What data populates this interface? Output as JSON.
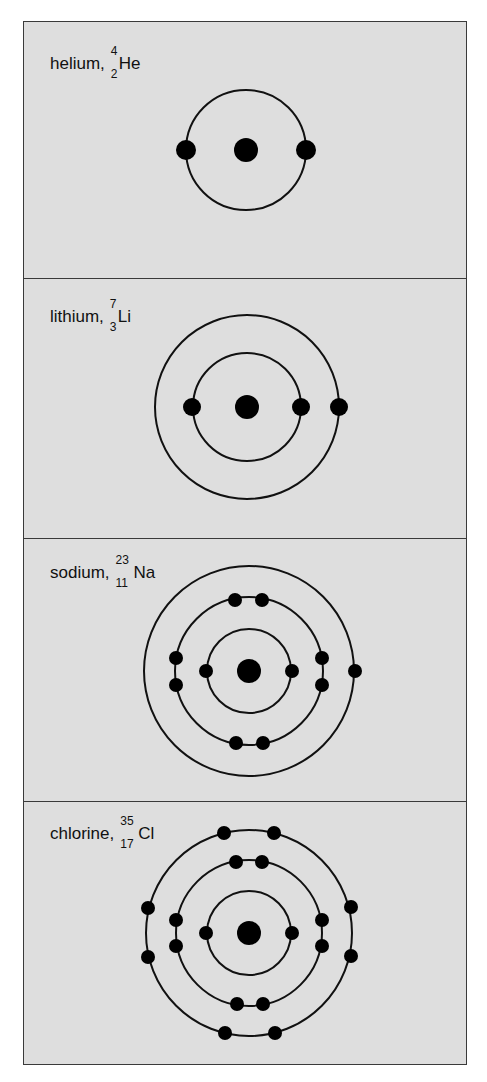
{
  "colors": {
    "background": "#dedede",
    "stroke": "#111111",
    "border": "#3a3a3a"
  },
  "panels": [
    {
      "name": "helium",
      "label": "helium,",
      "mass": "4",
      "atomic_number": "2",
      "symbol": "He",
      "shells": [
        2
      ]
    },
    {
      "name": "lithium",
      "label": "lithium,",
      "mass": "7",
      "atomic_number": "3",
      "symbol": "Li",
      "shells": [
        2,
        1
      ]
    },
    {
      "name": "sodium",
      "label": "sodium,",
      "mass": "23",
      "atomic_number": "11",
      "symbol": "Na",
      "shells": [
        2,
        8,
        1
      ]
    },
    {
      "name": "chlorine",
      "label": "chlorine,",
      "mass": "35",
      "atomic_number": "17",
      "symbol": "Cl",
      "shells": [
        2,
        8,
        7
      ]
    }
  ]
}
